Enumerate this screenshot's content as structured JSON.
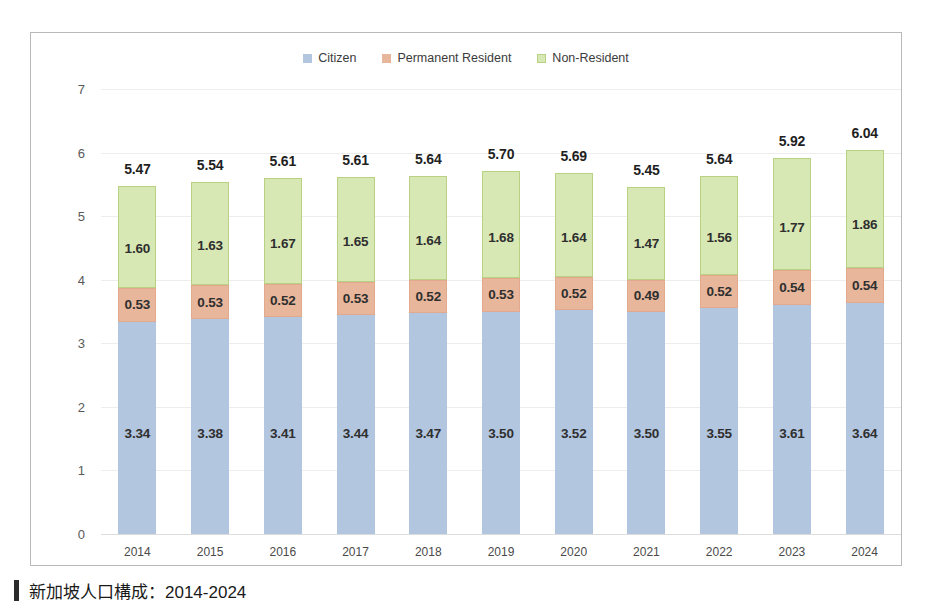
{
  "caption": {
    "text": "新加坡人口構成：2014-2024",
    "marker": "vertical-bar"
  },
  "colors": {
    "citizen": "#b2c6e0",
    "permanent_resident": "#e8b69b",
    "non_resident": "#d8e8b4",
    "panel_border": "#b9b9b9",
    "gridline": "#ededed"
  },
  "chart_data": {
    "type": "bar",
    "stacked": true,
    "title": "",
    "subtitle": "",
    "xlabel": "",
    "ylabel": "Million",
    "ylim": [
      0,
      7
    ],
    "yticks": [
      "0",
      "1",
      "2",
      "3",
      "4",
      "5",
      "6",
      "7"
    ],
    "grid": true,
    "legend_position": "top-center",
    "categories": [
      "2014",
      "2015",
      "2016",
      "2017",
      "2018",
      "2019",
      "2020",
      "2021",
      "2022",
      "2023",
      "2024"
    ],
    "series": [
      {
        "name": "Citizen",
        "color": "#b2c6e0",
        "values": [
          3.34,
          3.38,
          3.41,
          3.44,
          3.47,
          3.5,
          3.52,
          3.5,
          3.55,
          3.61,
          3.64
        ]
      },
      {
        "name": "Permanent Resident",
        "color": "#e8b69b",
        "values": [
          0.53,
          0.53,
          0.52,
          0.53,
          0.52,
          0.53,
          0.52,
          0.49,
          0.52,
          0.54,
          0.54
        ]
      },
      {
        "name": "Non-Resident",
        "color": "#d8e8b4",
        "values": [
          1.6,
          1.63,
          1.67,
          1.65,
          1.64,
          1.68,
          1.64,
          1.47,
          1.56,
          1.77,
          1.86
        ]
      }
    ],
    "totals": [
      5.47,
      5.54,
      5.61,
      5.61,
      5.64,
      5.7,
      5.69,
      5.45,
      5.64,
      5.92,
      6.04
    ],
    "labels": {
      "citizen": [
        "3.34",
        "3.38",
        "3.41",
        "3.44",
        "3.47",
        "3.50",
        "3.52",
        "3.50",
        "3.55",
        "3.61",
        "3.64"
      ],
      "permanent_resident": [
        "0.53",
        "0.53",
        "0.52",
        "0.53",
        "0.52",
        "0.53",
        "0.52",
        "0.49",
        "0.52",
        "0.54",
        "0.54"
      ],
      "non_resident": [
        "1.60",
        "1.63",
        "1.67",
        "1.65",
        "1.64",
        "1.68",
        "1.64",
        "1.47",
        "1.56",
        "1.77",
        "1.86"
      ],
      "totals": [
        "5.47",
        "5.54",
        "5.61",
        "5.61",
        "5.64",
        "5.70",
        "5.69",
        "5.45",
        "5.64",
        "5.92",
        "6.04"
      ]
    }
  }
}
